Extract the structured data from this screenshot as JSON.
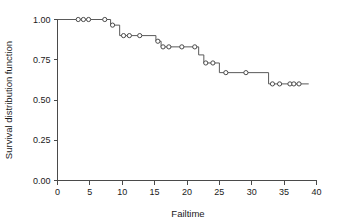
{
  "chart_data": {
    "type": "line",
    "title": "",
    "xlabel": "Failtime",
    "ylabel": "Survival distribution function",
    "xlim": [
      0,
      40
    ],
    "ylim": [
      0.0,
      1.0
    ],
    "xticks": [
      "0",
      "5",
      "10",
      "15",
      "20",
      "25",
      "30",
      "35",
      "40"
    ],
    "xtick_values": [
      0,
      5,
      10,
      15,
      20,
      25,
      30,
      35,
      40
    ],
    "yticks": [
      "0.00",
      "0.25",
      "0.50",
      "0.75",
      "1.00"
    ],
    "ytick_values": [
      0.0,
      0.25,
      0.5,
      0.75,
      1.0
    ],
    "grid": false,
    "legend": "none",
    "series": [
      {
        "name": "Survival distribution function",
        "style": "step-post",
        "line_color": "#5a5a5a",
        "marker": "open-circle",
        "marker_color": "#4a4a4a",
        "x": [
          0.0,
          3.2,
          4.0,
          4.8,
          7.3,
          8.6,
          10.1,
          11.0,
          12.4,
          14.0,
          15.5,
          15.9,
          16.4,
          18.5,
          20.1,
          22.1,
          22.6,
          23.1,
          24.0,
          25.5,
          27.5,
          31.4,
          33.1,
          34.4,
          35.5,
          37.7
        ],
        "y": [
          1.0,
          1.0,
          1.0,
          1.0,
          1.0,
          0.965,
          0.9,
          0.9,
          0.9,
          0.9,
          0.865,
          0.865,
          0.83,
          0.83,
          0.83,
          0.83,
          0.78,
          0.73,
          0.73,
          0.67,
          0.67,
          0.67,
          0.6,
          0.6,
          0.6,
          0.6
        ]
      }
    ],
    "step_levels": [
      1.0,
      0.965,
      0.9,
      0.865,
      0.83,
      0.78,
      0.73,
      0.67,
      0.6
    ],
    "step_path_points": [
      {
        "x": 0.0,
        "y": 1.0
      },
      {
        "x": 8.2,
        "y": 1.0
      },
      {
        "x": 8.2,
        "y": 0.965
      },
      {
        "x": 9.6,
        "y": 0.965
      },
      {
        "x": 9.6,
        "y": 0.9
      },
      {
        "x": 15.2,
        "y": 0.9
      },
      {
        "x": 15.2,
        "y": 0.865
      },
      {
        "x": 16.0,
        "y": 0.865
      },
      {
        "x": 16.0,
        "y": 0.83
      },
      {
        "x": 21.8,
        "y": 0.83
      },
      {
        "x": 21.8,
        "y": 0.78
      },
      {
        "x": 22.6,
        "y": 0.78
      },
      {
        "x": 22.6,
        "y": 0.73
      },
      {
        "x": 25.0,
        "y": 0.73
      },
      {
        "x": 25.0,
        "y": 0.67
      },
      {
        "x": 32.6,
        "y": 0.67
      },
      {
        "x": 32.6,
        "y": 0.6
      },
      {
        "x": 38.8,
        "y": 0.6
      }
    ],
    "censored_points": [
      {
        "x": 3.2,
        "y": 1.0
      },
      {
        "x": 4.0,
        "y": 1.0
      },
      {
        "x": 4.8,
        "y": 1.0
      },
      {
        "x": 7.3,
        "y": 1.0
      },
      {
        "x": 8.5,
        "y": 0.965
      },
      {
        "x": 10.2,
        "y": 0.9
      },
      {
        "x": 11.1,
        "y": 0.9
      },
      {
        "x": 12.7,
        "y": 0.9
      },
      {
        "x": 15.5,
        "y": 0.865
      },
      {
        "x": 16.3,
        "y": 0.83
      },
      {
        "x": 17.2,
        "y": 0.83
      },
      {
        "x": 19.2,
        "y": 0.83
      },
      {
        "x": 21.2,
        "y": 0.83
      },
      {
        "x": 22.9,
        "y": 0.73
      },
      {
        "x": 24.0,
        "y": 0.73
      },
      {
        "x": 26.0,
        "y": 0.67
      },
      {
        "x": 29.1,
        "y": 0.67
      },
      {
        "x": 33.2,
        "y": 0.6
      },
      {
        "x": 34.3,
        "y": 0.6
      },
      {
        "x": 35.9,
        "y": 0.6
      },
      {
        "x": 36.5,
        "y": 0.6
      },
      {
        "x": 37.3,
        "y": 0.6
      }
    ]
  }
}
